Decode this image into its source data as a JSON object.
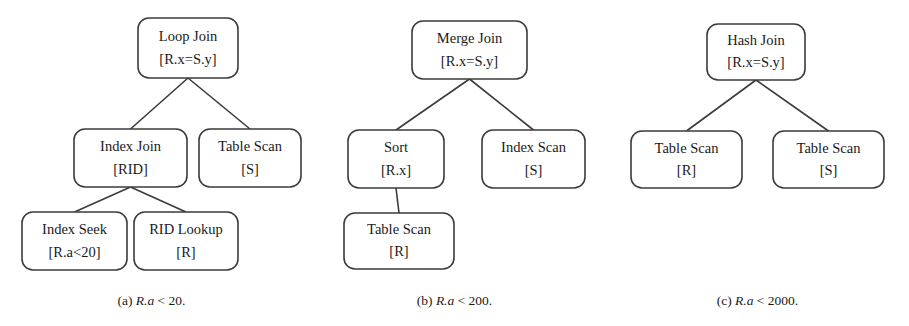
{
  "figure": {
    "type": "query-plan-diagram",
    "background_color": "#ffffff",
    "node_stroke_color": "#3b3b3b",
    "text_color": "#1a1a1a",
    "panels": [
      {
        "id": "panel-a",
        "caption_label": "(a)",
        "caption_expr": "R.a",
        "caption_tail": " < 20.",
        "caption_full": "(a) R.a < 20.",
        "nodes": [
          {
            "id": "a-root",
            "line1": "Loop Join",
            "line2": "[R.x=S.y]",
            "x": 138,
            "y": 18,
            "w": 100,
            "h": 60
          },
          {
            "id": "a-l1",
            "line1": "Index Join",
            "line2": "[RID]",
            "x": 74,
            "y": 129,
            "w": 113,
            "h": 58
          },
          {
            "id": "a-r1",
            "line1": "Table Scan",
            "line2": "[S]",
            "x": 199,
            "y": 129,
            "w": 102,
            "h": 58
          },
          {
            "id": "a-l2",
            "line1": "Index Seek",
            "line2": "[R.a<20]",
            "x": 22,
            "y": 212,
            "w": 105,
            "h": 58
          },
          {
            "id": "a-r2",
            "line1": "RID Lookup",
            "line2": "[R]",
            "x": 134,
            "y": 212,
            "w": 104,
            "h": 58
          }
        ],
        "edges": [
          {
            "from": "a-root",
            "to": "a-l1"
          },
          {
            "from": "a-root",
            "to": "a-r1"
          },
          {
            "from": "a-l1",
            "to": "a-l2"
          },
          {
            "from": "a-l1",
            "to": "a-r2"
          }
        ]
      },
      {
        "id": "panel-b",
        "caption_label": "(b)",
        "caption_expr": "R.a",
        "caption_tail": " < 200.",
        "caption_full": "(b) R.a < 200.",
        "nodes": [
          {
            "id": "b-root",
            "line1": "Merge Join",
            "line2": "[R.x=S.y]",
            "x": 412,
            "y": 21,
            "w": 115,
            "h": 58
          },
          {
            "id": "b-l1",
            "line1": "Sort",
            "line2": "[R.x]",
            "x": 348,
            "y": 130,
            "w": 96,
            "h": 58
          },
          {
            "id": "b-r1",
            "line1": "Index Scan",
            "line2": "[S]",
            "x": 482,
            "y": 130,
            "w": 103,
            "h": 58
          },
          {
            "id": "b-l2",
            "line1": "Table Scan",
            "line2": "[R]",
            "x": 344,
            "y": 213,
            "w": 110,
            "h": 56
          }
        ],
        "edges": [
          {
            "from": "b-root",
            "to": "b-l1"
          },
          {
            "from": "b-root",
            "to": "b-r1"
          },
          {
            "from": "b-l1",
            "to": "b-l2"
          }
        ]
      },
      {
        "id": "panel-c",
        "caption_label": "(c)",
        "caption_expr": "R.a",
        "caption_tail": " < 2000.",
        "caption_full": "(c) R.a < 2000.",
        "nodes": [
          {
            "id": "c-root",
            "line1": "Hash Join",
            "line2": "[R.x=S.y]",
            "x": 707,
            "y": 24,
            "w": 98,
            "h": 56
          },
          {
            "id": "c-l1",
            "line1": "Table Scan",
            "line2": "[R]",
            "x": 631,
            "y": 131,
            "w": 111,
            "h": 57
          },
          {
            "id": "c-r1",
            "line1": "Table Scan",
            "line2": "[S]",
            "x": 773,
            "y": 131,
            "w": 111,
            "h": 57
          }
        ],
        "edges": [
          {
            "from": "c-root",
            "to": "c-l1"
          },
          {
            "from": "c-root",
            "to": "c-r1"
          }
        ]
      }
    ],
    "captions_layout": [
      {
        "panel": "panel-a",
        "left": 0,
        "top": 293,
        "width": 303
      },
      {
        "panel": "panel-b",
        "left": 303,
        "top": 293,
        "width": 303
      },
      {
        "panel": "panel-c",
        "left": 606,
        "top": 293,
        "width": 303
      }
    ]
  }
}
